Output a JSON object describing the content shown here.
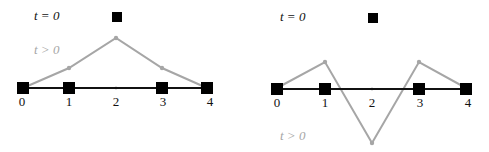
{
  "panels": [
    {
      "id": "left",
      "label_t0": "t = 0",
      "label_tpos": "t > 0",
      "tick_labels": [
        "0",
        "1",
        "2",
        "3",
        "4"
      ],
      "description": "Initial state: squares at nodes 0,1,3,4 on baseline and node 2 displaced up; later state (gray) shows a smooth tent shape peaking at node 2"
    },
    {
      "id": "right",
      "label_t0": "t = 0",
      "label_tpos": "t > 0",
      "tick_labels": [
        "0",
        "1",
        "2",
        "3",
        "4"
      ],
      "description": "Initial state: squares at nodes 0,1,3,4 on baseline and node 2 displaced up; later state (gray) shows oscillating shape with node 2 far below baseline"
    }
  ],
  "colors": {
    "initial": "#000000",
    "later": "#a6a6a6",
    "baseline": "#111111"
  }
}
